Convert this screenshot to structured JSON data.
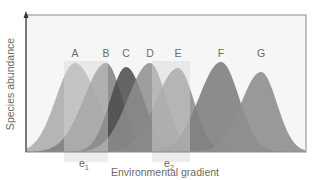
{
  "figure": {
    "y_axis_label": "Species abundance",
    "x_axis_label": "Environmental gradient",
    "plot_background": "#f6f6f6",
    "frame_color": "#8a8a8a"
  },
  "species": [
    {
      "label": "A",
      "peak_x": 75,
      "peak_y": 63,
      "left_sigma": 19,
      "right_sigma": 22,
      "color": "#a9a9a9",
      "opacity": 0.85
    },
    {
      "label": "B",
      "peak_x": 106,
      "peak_y": 63,
      "left_sigma": 22,
      "right_sigma": 16,
      "color": "#7f7f7f",
      "opacity": 0.85
    },
    {
      "label": "C",
      "peak_x": 126,
      "peak_y": 67,
      "left_sigma": 16,
      "right_sigma": 18,
      "color": "#4a4a4a",
      "opacity": 0.85
    },
    {
      "label": "D",
      "peak_x": 150,
      "peak_y": 63,
      "left_sigma": 22,
      "right_sigma": 16,
      "color": "#8d8d8d",
      "opacity": 0.85
    },
    {
      "label": "E",
      "peak_x": 178,
      "peak_y": 68,
      "left_sigma": 22,
      "right_sigma": 16,
      "color": "#8a8a8a",
      "opacity": 0.85
    },
    {
      "label": "F",
      "peak_x": 221,
      "peak_y": 62,
      "left_sigma": 22,
      "right_sigma": 18,
      "color": "#818181",
      "opacity": 0.9
    },
    {
      "label": "G",
      "peak_x": 261,
      "peak_y": 72,
      "left_sigma": 20,
      "right_sigma": 16,
      "color": "#8f8f8f",
      "opacity": 0.9
    }
  ],
  "sample_points": [
    {
      "label": "e",
      "subscript": "1",
      "x_start": 64,
      "x_end": 108
    },
    {
      "label": "e",
      "subscript": "2",
      "x_start": 152,
      "x_end": 190
    }
  ]
}
